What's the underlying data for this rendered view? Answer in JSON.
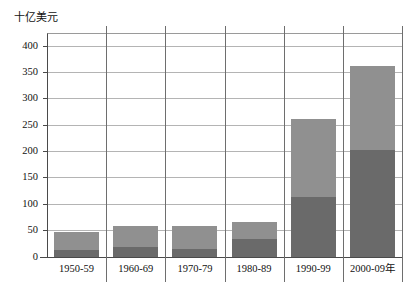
{
  "chart_data": {
    "type": "bar",
    "subtype": "stacked-bar",
    "title": "",
    "ylabel": "十亿美元",
    "xlabel": "",
    "categories": [
      "1950-59",
      "1960-69",
      "1970-79",
      "1980-89",
      "1990-99",
      "2000-09年"
    ],
    "ylim": [
      0,
      425
    ],
    "yticks": [
      0,
      50,
      100,
      150,
      200,
      250,
      300,
      350,
      400
    ],
    "ytick_labels": [
      "0",
      "50",
      "100",
      "150",
      "200",
      "250",
      "300",
      "350",
      "400"
    ],
    "grid": true,
    "legend": "none",
    "series": [
      {
        "name": "lower-segment",
        "color": "#6a6a6a",
        "values": [
          13,
          18,
          16,
          35,
          113,
          203
        ]
      },
      {
        "name": "upper-segment",
        "color": "#909090",
        "values": [
          35,
          40,
          42,
          32,
          149,
          160
        ]
      }
    ],
    "totals": [
      48,
      58,
      58,
      67,
      262,
      363
    ]
  },
  "axis": {
    "unit_title": "十亿美元"
  }
}
